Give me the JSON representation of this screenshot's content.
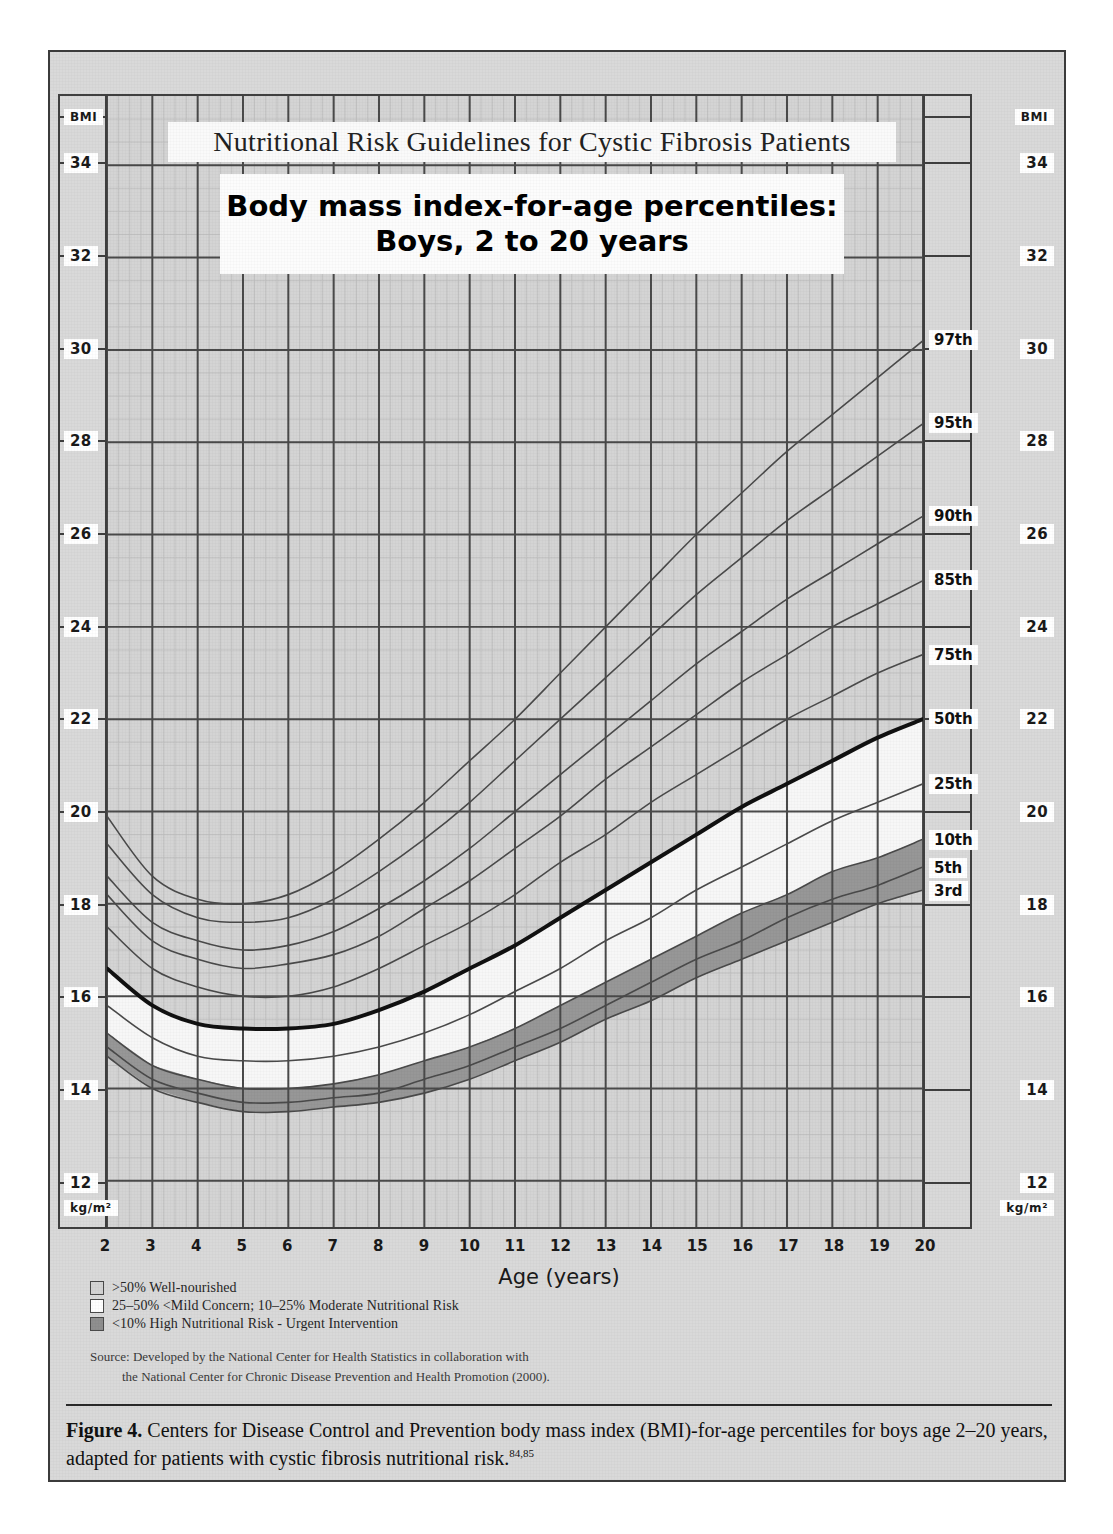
{
  "figure": {
    "caption_label": "Figure 4.",
    "caption_text": " Centers for Disease Control and Prevention body mass index (BMI)-for-age percentiles for boys age 2–20 years, adapted for patients with cystic fibrosis nutritional risk.",
    "caption_refs": "84,85"
  },
  "chart": {
    "banner_title": "Nutritional Risk Guidelines for Cystic Fibrosis Patients",
    "main_title_line1": "Body mass index-for-age percentiles:",
    "main_title_line2": "Boys, 2 to 20 years",
    "y_axis_top_label": "BMI",
    "y_axis_bottom_label": "kg/m²",
    "x_axis_title": "Age (years)"
  },
  "legend": {
    "items": [
      {
        "swatch": "grey",
        "color": "#d4d4d4",
        "label": ">50% Well-nourished"
      },
      {
        "swatch": "white",
        "color": "#ffffff",
        "label": "25–50% <Mild Concern; 10–25% Moderate Nutritional Risk"
      },
      {
        "swatch": "dark-grey",
        "color": "#8f8f8f",
        "label": "<10% High Nutritional Risk - Urgent Intervention"
      }
    ]
  },
  "source": {
    "line1": "Source: Developed by the National Center for Health Statistics in collaboration with",
    "line2": "the National Center for Chronic Disease Prevention and Health Promotion (2000)."
  },
  "chart_data": {
    "type": "line",
    "title": "Body mass index-for-age percentiles: Boys, 2 to 20 years",
    "xlabel": "Age (years)",
    "ylabel": "BMI",
    "yunit": "kg/m²",
    "xlim": [
      2,
      20
    ],
    "ylim": [
      11,
      35.5
    ],
    "xticks": [
      2,
      3,
      4,
      5,
      6,
      7,
      8,
      9,
      10,
      11,
      12,
      13,
      14,
      15,
      16,
      17,
      18,
      19,
      20
    ],
    "yticks": [
      12,
      14,
      16,
      18,
      20,
      22,
      24,
      26,
      28,
      30,
      32,
      34
    ],
    "grid": true,
    "legend_position": "right-inline-labels",
    "x": [
      2,
      3,
      4,
      5,
      6,
      7,
      8,
      9,
      10,
      11,
      12,
      13,
      14,
      15,
      16,
      17,
      18,
      19,
      20
    ],
    "series": [
      {
        "name": "97th",
        "color": "#4a4a4a",
        "width": 1.6,
        "values": [
          19.9,
          18.6,
          18.1,
          18.0,
          18.2,
          18.7,
          19.4,
          20.2,
          21.1,
          22.0,
          23.0,
          24.0,
          25.0,
          26.0,
          26.9,
          27.8,
          28.6,
          29.4,
          30.2
        ]
      },
      {
        "name": "95th",
        "color": "#4a4a4a",
        "width": 1.6,
        "values": [
          19.3,
          18.2,
          17.7,
          17.6,
          17.7,
          18.1,
          18.7,
          19.4,
          20.2,
          21.1,
          22.0,
          22.9,
          23.8,
          24.7,
          25.5,
          26.3,
          27.0,
          27.7,
          28.4
        ]
      },
      {
        "name": "90th",
        "color": "#4a4a4a",
        "width": 1.6,
        "values": [
          18.6,
          17.6,
          17.2,
          17.0,
          17.1,
          17.4,
          17.9,
          18.5,
          19.2,
          20.0,
          20.8,
          21.6,
          22.4,
          23.2,
          23.9,
          24.6,
          25.2,
          25.8,
          26.4
        ]
      },
      {
        "name": "85th",
        "color": "#4a4a4a",
        "width": 1.6,
        "values": [
          18.2,
          17.2,
          16.8,
          16.6,
          16.7,
          16.9,
          17.3,
          17.9,
          18.5,
          19.2,
          19.9,
          20.7,
          21.4,
          22.1,
          22.8,
          23.4,
          24.0,
          24.5,
          25.0
        ]
      },
      {
        "name": "75th",
        "color": "#4a4a4a",
        "width": 1.6,
        "values": [
          17.5,
          16.6,
          16.2,
          16.0,
          16.0,
          16.2,
          16.6,
          17.1,
          17.6,
          18.2,
          18.9,
          19.5,
          20.2,
          20.8,
          21.4,
          22.0,
          22.5,
          23.0,
          23.4
        ]
      },
      {
        "name": "50th",
        "color": "#111111",
        "width": 4.0,
        "values": [
          16.6,
          15.8,
          15.4,
          15.3,
          15.3,
          15.4,
          15.7,
          16.1,
          16.6,
          17.1,
          17.7,
          18.3,
          18.9,
          19.5,
          20.1,
          20.6,
          21.1,
          21.6,
          22.0
        ]
      },
      {
        "name": "25th",
        "color": "#4a4a4a",
        "width": 1.6,
        "values": [
          15.8,
          15.1,
          14.7,
          14.6,
          14.6,
          14.7,
          14.9,
          15.2,
          15.6,
          16.1,
          16.6,
          17.2,
          17.7,
          18.3,
          18.8,
          19.3,
          19.8,
          20.2,
          20.6
        ]
      },
      {
        "name": "10th",
        "color": "#4a4a4a",
        "width": 1.6,
        "values": [
          15.2,
          14.5,
          14.2,
          14.0,
          14.0,
          14.1,
          14.3,
          14.6,
          14.9,
          15.3,
          15.8,
          16.3,
          16.8,
          17.3,
          17.8,
          18.2,
          18.7,
          19.0,
          19.4
        ]
      },
      {
        "name": "5th",
        "color": "#4a4a4a",
        "width": 1.6,
        "values": [
          14.9,
          14.2,
          13.9,
          13.7,
          13.7,
          13.8,
          13.9,
          14.2,
          14.5,
          14.9,
          15.3,
          15.8,
          16.3,
          16.8,
          17.2,
          17.7,
          18.1,
          18.4,
          18.8
        ]
      },
      {
        "name": "3rd",
        "color": "#4a4a4a",
        "width": 1.6,
        "values": [
          14.7,
          14.0,
          13.7,
          13.5,
          13.5,
          13.6,
          13.7,
          13.9,
          14.2,
          14.6,
          15.0,
          15.5,
          15.9,
          16.4,
          16.8,
          17.2,
          17.6,
          18.0,
          18.3
        ]
      }
    ],
    "bands": [
      {
        "name": "well-nourished",
        "above": "50th",
        "fill": "#d4d4d4"
      },
      {
        "name": "mild-moderate-concern",
        "from": "10th",
        "to": "50th",
        "fill": "#f7f7f7"
      },
      {
        "name": "high-risk",
        "from": "3rd",
        "to": "10th",
        "fill": "#8f8f8f"
      }
    ]
  }
}
